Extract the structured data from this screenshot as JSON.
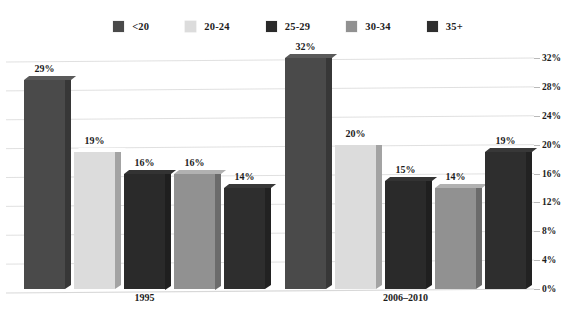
{
  "chart_data": {
    "type": "bar",
    "title": "",
    "subtitle": "",
    "xlabel": "",
    "ylabel": "",
    "categories": [
      "1995",
      "2006–2010"
    ],
    "series": [
      {
        "name": "<20",
        "values": [
          29,
          19
        ],
        "color": "#4a4a4a"
      },
      {
        "name": "20-24",
        "values": [
          19,
          20
        ],
        "color": "#dcdcdc"
      },
      {
        "name": "25-29",
        "values": [
          16,
          15
        ],
        "color": "#2a2a2a"
      },
      {
        "name": "30-34",
        "values": [
          16,
          14
        ],
        "color": "#919191"
      },
      {
        "name": "35+",
        "values": [
          14,
          19
        ],
        "color": "#2e2e2e"
      }
    ],
    "value_labels": [
      "29%",
      "19%",
      "16%",
      "16%",
      "14%",
      "32%",
      "20%",
      "15%",
      "14%",
      "19%"
    ],
    "ylim": [
      0,
      32
    ],
    "ytick_values": [
      0,
      4,
      8,
      12,
      16,
      20,
      24,
      28,
      32
    ],
    "ytick_labels": [
      "0%",
      "4%",
      "8%",
      "12%",
      "16%",
      "20%",
      "24%",
      "28%",
      "32%"
    ],
    "yaxis_position": "right",
    "grid": true,
    "grid_axis": "y",
    "legend": true,
    "legend_position": "top",
    "style": "3d-column",
    "bars": [
      {
        "group": "1995",
        "series": "<20",
        "value": 29,
        "label": "29%",
        "color": "#4a4a4a"
      },
      {
        "group": "1995",
        "series": "20-24",
        "value": 19,
        "label": "19%",
        "color": "#dcdcdc"
      },
      {
        "group": "1995",
        "series": "25-29",
        "value": 16,
        "label": "16%",
        "color": "#2a2a2a"
      },
      {
        "group": "1995",
        "series": "30-34",
        "value": 16,
        "label": "16%",
        "color": "#919191"
      },
      {
        "group": "1995",
        "series": "35+",
        "value": 14,
        "label": "14%",
        "color": "#2e2e2e"
      },
      {
        "group": "2006–2010",
        "series": "<20",
        "value": 32,
        "label": "32%",
        "color": "#4a4a4a"
      },
      {
        "group": "2006–2010",
        "series": "20-24",
        "value": 20,
        "label": "20%",
        "color": "#dcdcdc"
      },
      {
        "group": "2006–2010",
        "series": "25-29",
        "value": 15,
        "label": "15%",
        "color": "#2a2a2a"
      },
      {
        "group": "2006–2010",
        "series": "30-34",
        "value": 14,
        "label": "14%",
        "color": "#919191"
      },
      {
        "group": "2006–2010",
        "series": "35+",
        "value": 19,
        "label": "19%",
        "color": "#2e2e2e"
      }
    ]
  },
  "legend": {
    "items": [
      {
        "label": "<20",
        "color": "#4a4a4a"
      },
      {
        "label": "20-24",
        "color": "#dcdcdc"
      },
      {
        "label": "25-29",
        "color": "#2a2a2a"
      },
      {
        "label": "30-34",
        "color": "#919191"
      },
      {
        "label": "35+",
        "color": "#2e2e2e"
      }
    ]
  },
  "axis": {
    "y_labels": [
      "32%",
      "28%",
      "24%",
      "20%",
      "16%",
      "12%",
      "8%",
      "4%",
      "0%"
    ]
  },
  "groups": [
    {
      "label": "1995"
    },
    {
      "label": "2006–2010"
    }
  ],
  "colors": {
    "background": "#ffffff",
    "text": "#1c1c1c",
    "gridline": "#d8d8d8"
  }
}
